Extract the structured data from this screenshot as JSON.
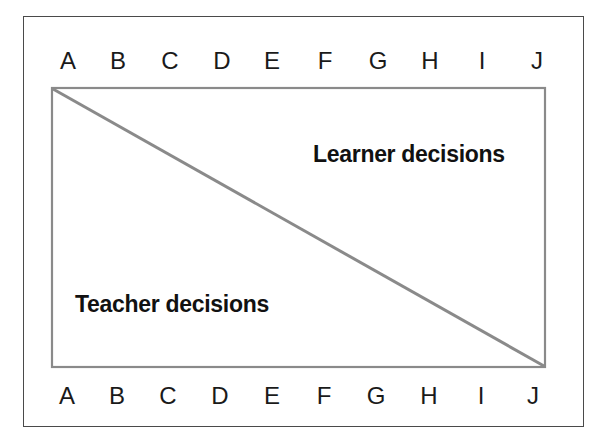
{
  "diagram": {
    "type": "continuum",
    "top_scale": {
      "letters": [
        "A",
        "B",
        "C",
        "D",
        "E",
        "F",
        "G",
        "H",
        "I",
        "J"
      ]
    },
    "bottom_scale": {
      "letters": [
        "A",
        "B",
        "C",
        "D",
        "E",
        "F",
        "G",
        "H",
        "I",
        "J"
      ]
    },
    "regions": {
      "upper_right": {
        "label": "Learner decisions"
      },
      "lower_left": {
        "label": "Teacher decisions"
      }
    },
    "colors": {
      "frame": "#4a4a4a",
      "inner_box": "#8a8a8a",
      "diagonal": "#8a8a8a",
      "text": "#1a1a1a"
    }
  }
}
